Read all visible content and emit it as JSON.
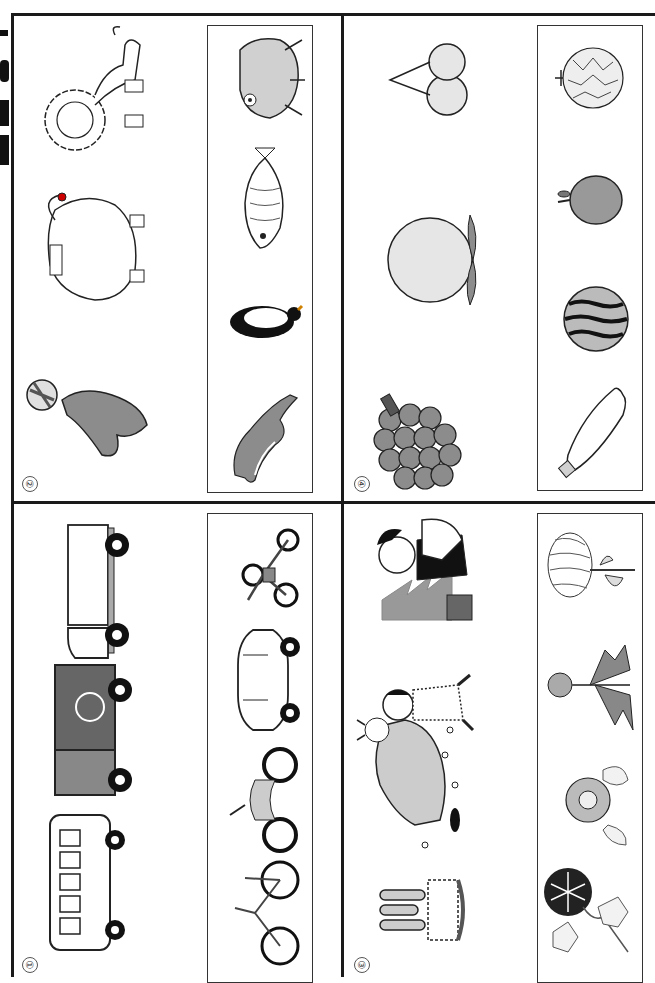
{
  "worksheet": {
    "title_fragment": "",
    "orientation": "rotated 90deg clockwise",
    "colors": {
      "line": "#1a1a1a",
      "fill_gray": "#8c8c8c",
      "light_gray": "#d9d9d9"
    }
  },
  "sections": [
    {
      "number": "①",
      "theme": "vehicles",
      "top_items": [
        "bus-icon",
        "fire-truck-icon",
        "truck-icon"
      ],
      "box_items": [
        "bicycle-icon",
        "motorcycle-icon",
        "car-icon",
        "tricycle-icon"
      ]
    },
    {
      "number": "②",
      "theme": "animals",
      "top_items": [
        "sea-lion-icon",
        "elephant-icon",
        "lion-icon"
      ],
      "box_items": [
        "dolphin-icon",
        "penguin-icon",
        "fish-icon",
        "frog-icon"
      ]
    },
    {
      "number": "③",
      "theme": "events",
      "top_items": [
        "kadomatsu-icon",
        "setsubun-oni-icon",
        "christmas-santa-icon"
      ],
      "box_items": [
        "morning-glory-icon",
        "camellia-icon",
        "dandelion-icon",
        "chrysanthemum-icon"
      ]
    },
    {
      "number": "④",
      "theme": "fruits",
      "top_items": [
        "grapes-icon",
        "peach-icon",
        "cherries-icon"
      ],
      "box_items": [
        "daikon-icon",
        "watermelon-icon",
        "apple-icon",
        "melon-icon"
      ]
    }
  ]
}
